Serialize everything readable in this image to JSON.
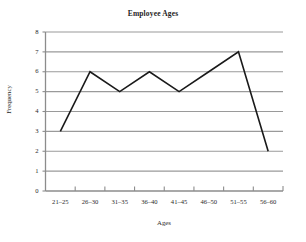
{
  "chart_data": {
    "type": "line",
    "title": "Employee Ages",
    "xlabel": "Ages",
    "ylabel": "Frequency",
    "categories": [
      "21–25",
      "26–30",
      "31–35",
      "36–40",
      "41–45",
      "46–50",
      "51–55",
      "56–60"
    ],
    "values": [
      3,
      6,
      5,
      6,
      5,
      6,
      7,
      2
    ],
    "ylim": [
      0,
      8
    ],
    "yticks": [
      0,
      1,
      2,
      3,
      4,
      5,
      6,
      7,
      8
    ],
    "ytick_labels": [
      "0",
      "1",
      "2",
      "3",
      "4",
      "5",
      "6",
      "7",
      "8"
    ],
    "grid": true,
    "grid_axis": "y",
    "legend": false,
    "series": [
      {
        "name": "Frequency",
        "values": [
          3,
          6,
          5,
          6,
          5,
          6,
          7,
          2
        ]
      }
    ],
    "colors": {
      "line": "#1a1a1a",
      "grid": "#9a9a9a",
      "axis": "#8c8c8c",
      "background": "#ffffff",
      "text": "#2a2a2a"
    }
  }
}
